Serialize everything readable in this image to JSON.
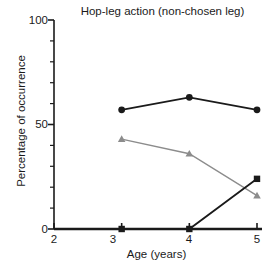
{
  "chart_data": {
    "type": "line",
    "title": "Hop-leg action (non-chosen leg)",
    "xlabel": "Age (years)",
    "ylabel": "Percentage of occurrence",
    "x": [
      3,
      4,
      5
    ],
    "xlim": [
      2,
      5
    ],
    "ylim": [
      0,
      100
    ],
    "xticks": [
      2,
      3,
      4,
      5
    ],
    "xtick_labels": [
      "2",
      "3",
      "4",
      "5"
    ],
    "yticks": [
      0,
      50,
      100
    ],
    "ytick_labels": [
      "0",
      "50",
      "100"
    ],
    "yminor_ticks": [
      10,
      20,
      30,
      40,
      60,
      70,
      80,
      90
    ],
    "grid": false,
    "legend": "none",
    "series": [
      {
        "name": "circle-series",
        "marker": "circle",
        "color": "#1a1a1a",
        "values": [
          57,
          63,
          57
        ]
      },
      {
        "name": "triangle-series",
        "marker": "triangle",
        "color": "#8c8c8c",
        "values": [
          43,
          36,
          16
        ]
      },
      {
        "name": "square-series",
        "marker": "square",
        "color": "#1a1a1a",
        "values": [
          0,
          0,
          24
        ]
      }
    ]
  },
  "axis": {
    "tick_label_0": "0",
    "tick_label_50": "50",
    "tick_label_100": "100",
    "xtick_2": "2",
    "xtick_3": "3",
    "xtick_4": "4",
    "xtick_5": "5"
  },
  "colors": {
    "background": "#ffffff",
    "axis": "#1a1a1a",
    "dark_series": "#1a1a1a",
    "gray_series": "#8c8c8c"
  }
}
